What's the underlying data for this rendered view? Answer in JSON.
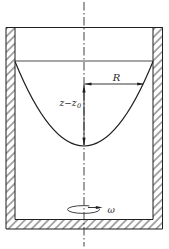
{
  "figure": {
    "background_color": "#ffffff",
    "ink_color": "#1f1f1f",
    "labels": {
      "radius": "R",
      "surface_height_main": "z−z",
      "surface_height_sub": "0",
      "angular_velocity": "ω"
    }
  }
}
